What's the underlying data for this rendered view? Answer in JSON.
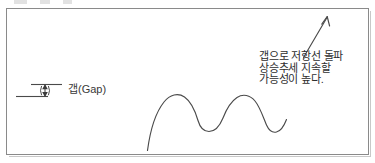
{
  "diagram": {
    "type": "hand-drawn-stock-chart-illustration",
    "background_color": "#ffffff",
    "line_color": "#4a4a4a",
    "frame_color": "#8a8a8a",
    "legend": {
      "symbol_name": "gap-double-arrow-icon",
      "label": "갭(Gap)"
    },
    "annotation": {
      "line1": "갭으로 저항선 돌파",
      "line2": "상승추세 지속할",
      "line3": "가능성이 높다."
    },
    "arrow": {
      "name": "breakout-up-arrow",
      "direction": "up-right"
    },
    "price_curve": {
      "name": "wave-price-line",
      "description": "rising line with two rounded peaks and troughs, ending rising to the right"
    }
  }
}
